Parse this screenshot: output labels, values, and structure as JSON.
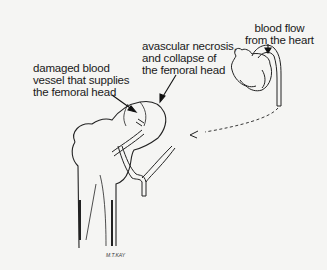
{
  "diagram": {
    "labels": {
      "damaged_vessel": [
        "damaged blood",
        "vessel that supplies",
        "the femoral head"
      ],
      "necrosis": [
        "avascular necrosis,",
        "and collapse of",
        "the femoral head"
      ],
      "blood_flow": [
        "blood flow",
        "from the heart"
      ]
    },
    "signature": "M.T.KAY",
    "colors": {
      "ink": "#1a1a1a",
      "background": "#f5f5f3"
    }
  }
}
